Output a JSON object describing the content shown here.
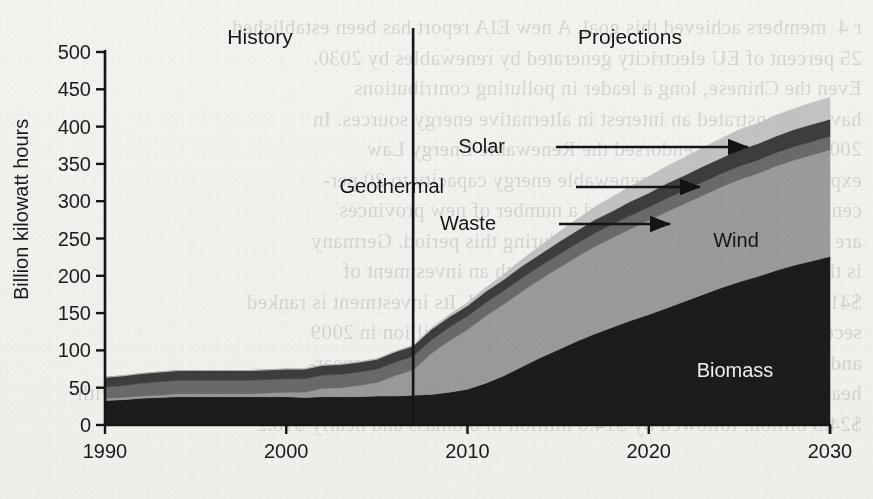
{
  "figure": {
    "period_labels": [
      {
        "name": "history",
        "text": "History",
        "x": 260,
        "y": 44
      },
      {
        "name": "projections",
        "text": "Projections",
        "x": 630,
        "y": 44
      }
    ],
    "divider_year": 2007
  },
  "axes": {
    "y_title": "Billion kilowatt hours",
    "y_ticks": [
      "0",
      "50",
      "100",
      "150",
      "200",
      "250",
      "300",
      "350",
      "400",
      "450",
      "500"
    ],
    "x_ticks": [
      "1990",
      "2000",
      "2010",
      "2020",
      "2030"
    ]
  },
  "annotations": {
    "solar": "Solar",
    "geothermal": "Geothermal",
    "waste": "Waste",
    "wind": "Wind",
    "biomass": "Biomass"
  },
  "colors": {
    "biomass": "#1d1d1d",
    "wind": "#9b9b9b",
    "waste": "#6a6a6a",
    "geothermal": "#3d3d3d",
    "solar": "#c3c3c3",
    "axis": "#151515",
    "paper": "#f3f2ef"
  },
  "bleed_text": [
    "  r 4  members achieved this goal. A new EIA report has been established",
    "  25 percent of EU electricity generated by renewables by 2030.",
    "  Even the Chinese, long a leader in polluting contributions",
    "  have demonstrated an interest in alternative energy sources. In",
    "  2009 the Congress endorsed the Renewable Energy Law",
    "  expanding the country's renewable energy capacity to 20 per-",
    "  cent of generation by 2025, and a number of new provinces",
    "  are investing in renewable energy during this period. Germany",
    "  is the leading clean energy producer, with an investment of",
    "  $41 billion, or 26 percent of the world's total. Its investment is ranked",
    "  second, followed by the United States with $24 billion in 2009",
    "  and then Brazil at $7.4 billion. Wind power continues to spear-",
    "  head global investment at $67 billion in clean energy. Solar investments led the way with",
    "  $24.3 billion, followed by $14.0 million in biomass and nearly $18.2"
  ],
  "chart_data": {
    "type": "area",
    "stacked": true,
    "title": "",
    "xlabel": "",
    "ylabel": "Billion kilowatt hours",
    "xlim": [
      1990,
      2030
    ],
    "ylim": [
      0,
      500
    ],
    "ytick_step": 50,
    "grid": false,
    "legend": "inline-labels",
    "x": [
      1990,
      1991,
      1992,
      1993,
      1994,
      1995,
      1996,
      1997,
      1998,
      1999,
      2000,
      2001,
      2002,
      2003,
      2004,
      2005,
      2006,
      2007,
      2008,
      2009,
      2010,
      2011,
      2012,
      2013,
      2014,
      2015,
      2016,
      2017,
      2018,
      2019,
      2020,
      2021,
      2022,
      2023,
      2024,
      2025,
      2026,
      2027,
      2028,
      2029,
      2030
    ],
    "series": [
      {
        "name": "Biomass",
        "color": "#1d1d1d",
        "values": [
          33,
          34,
          36,
          37,
          38,
          38,
          38,
          38,
          38,
          38,
          38,
          37,
          38,
          38,
          38,
          39,
          39,
          40,
          41,
          44,
          48,
          56,
          66,
          78,
          90,
          101,
          112,
          122,
          131,
          140,
          148,
          157,
          166,
          175,
          184,
          192,
          199,
          207,
          214,
          220,
          226
        ]
      },
      {
        "name": "Wind",
        "color": "#9b9b9b",
        "values": [
          3,
          3,
          3,
          3,
          4,
          4,
          4,
          4,
          4,
          5,
          6,
          7,
          11,
          12,
          15,
          18,
          27,
          34,
          55,
          69,
          80,
          90,
          96,
          101,
          105,
          109,
          113,
          117,
          120,
          123,
          126,
          129,
          131,
          133,
          135,
          137,
          138,
          140,
          141,
          142,
          143
        ]
      },
      {
        "name": "Waste",
        "color": "#6a6a6a",
        "values": [
          15,
          16,
          17,
          18,
          18,
          18,
          18,
          18,
          18,
          18,
          18,
          18,
          18,
          18,
          18,
          18,
          18,
          18,
          18,
          18,
          18,
          18,
          18,
          18,
          18,
          18,
          18,
          18,
          18,
          18,
          18,
          18,
          18,
          18,
          18,
          18,
          18,
          18,
          18,
          18,
          18
        ]
      },
      {
        "name": "Geothermal",
        "color": "#3d3d3d",
        "values": [
          13,
          13,
          13,
          13,
          13,
          13,
          13,
          13,
          13,
          13,
          13,
          13,
          13,
          13,
          13,
          13,
          14,
          14,
          14,
          14,
          14,
          15,
          15,
          16,
          16,
          17,
          17,
          18,
          18,
          19,
          19,
          20,
          20,
          21,
          21,
          22,
          22,
          22,
          23,
          23,
          23
        ]
      },
      {
        "name": "Solar",
        "color": "#c3c3c3",
        "values": [
          0,
          0,
          0,
          0,
          0,
          0,
          0,
          0,
          0,
          0,
          0,
          0,
          0,
          1,
          1,
          1,
          1,
          1,
          2,
          3,
          4,
          5,
          7,
          9,
          11,
          13,
          15,
          17,
          19,
          20,
          22,
          23,
          24,
          25,
          26,
          27,
          27,
          28,
          28,
          29,
          29
        ]
      }
    ],
    "callouts": [
      {
        "name": "Solar",
        "label_x": 505,
        "label_y": 153,
        "arrow_from_x": 556,
        "arrow_to_x": 748,
        "arrow_y": 147
      },
      {
        "name": "Geothermal",
        "label_x": 444,
        "label_y": 193,
        "arrow_from_x": 576,
        "arrow_to_x": 700,
        "arrow_y": 187
      },
      {
        "name": "Waste",
        "label_x": 496,
        "label_y": 230,
        "arrow_from_x": 559,
        "arrow_to_x": 670,
        "arrow_y": 224
      }
    ],
    "inline_labels": [
      {
        "name": "Wind",
        "x": 736,
        "y": 247,
        "light": false
      },
      {
        "name": "Biomass",
        "x": 735,
        "y": 377,
        "light": true
      }
    ]
  }
}
